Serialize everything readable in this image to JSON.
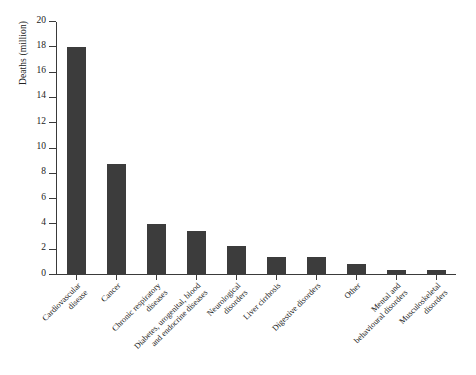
{
  "chart_data": {
    "type": "bar",
    "title": "",
    "xlabel": "",
    "ylabel": "Deaths (million)",
    "ylim": [
      0,
      20
    ],
    "ytick_values": [
      0,
      2,
      4,
      6,
      8,
      10,
      12,
      14,
      16,
      18,
      20
    ],
    "ytick_labels": [
      "0",
      "2",
      "4",
      "6",
      "8",
      "10",
      "12",
      "14",
      "16",
      "18",
      "20"
    ],
    "grid": false,
    "legend": null,
    "bar_color": "#3c3c3c",
    "axis_color": "#3a3a3a",
    "categories": [
      "Cardiovascular disease",
      "Cancer",
      "Chronic respiratory diseases",
      "Diabetes, urogenital, blood and endocrine diseases",
      "Neurological disorders",
      "Liver cirrhosis",
      "Digestive disorders",
      "Other",
      "Mental and behavioural disorders",
      "Musculoskeletal disorders"
    ],
    "category_lines": [
      [
        "Cardiovascular",
        "disease"
      ],
      [
        "Cancer",
        ""
      ],
      [
        "Chronic respiratory",
        "diseases"
      ],
      [
        "Diabetes, urogenital, blood",
        "and endocrine diseases"
      ],
      [
        "Neurological",
        "disorders"
      ],
      [
        "Liver cirrhosis",
        ""
      ],
      [
        "Digestive disorders",
        ""
      ],
      [
        "Other",
        ""
      ],
      [
        "Mental and",
        "behavioural disorders"
      ],
      [
        "Musculoskeletal",
        "disorders"
      ]
    ],
    "values": [
      18.0,
      8.8,
      4.0,
      3.5,
      2.3,
      1.4,
      1.4,
      0.9,
      0.4,
      0.4
    ],
    "units": "million deaths"
  }
}
